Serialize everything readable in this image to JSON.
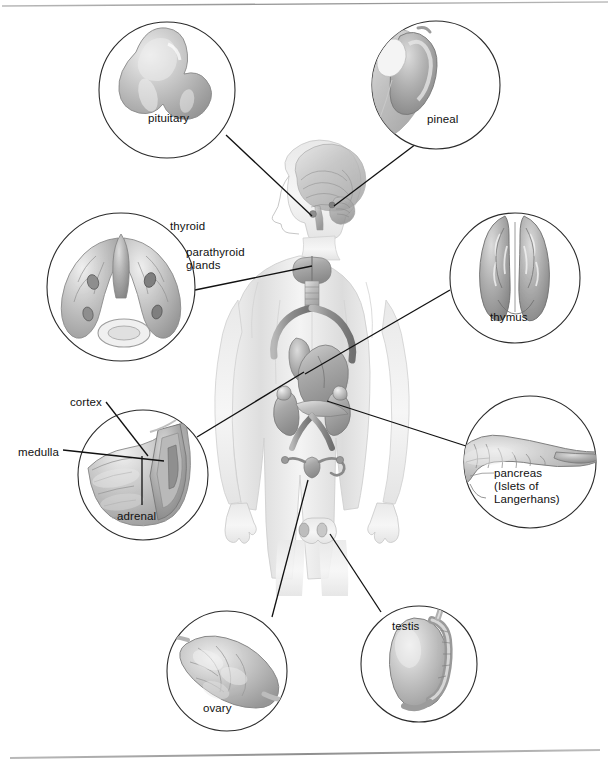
{
  "figure": {
    "background_color": "#ffffff",
    "line_color": "#111111",
    "rule_color": "#9a9a9a"
  },
  "rules": [
    {
      "name": "top-rule",
      "y": 4
    },
    {
      "name": "bottom-rule",
      "y": 755
    }
  ],
  "callouts": [
    {
      "id": "pituitary",
      "label": "pituitary",
      "label_x": 150,
      "label_y": 118,
      "circle": {
        "cx": 167,
        "cy": 90,
        "r": 68
      },
      "leader": {
        "x1": 226,
        "x2": 312,
        "y1": 135,
        "y2": 218
      }
    },
    {
      "id": "pineal",
      "label": "pineal",
      "label_x": 428,
      "label_y": 118,
      "circle": {
        "cx": 436,
        "cy": 85,
        "r": 64
      },
      "leader": {
        "x1": 418,
        "x2": 335,
        "y1": 143,
        "y2": 210
      }
    },
    {
      "id": "thyroid-parathyroid",
      "label": "thyroid",
      "label2": "parathyroid\nglands",
      "label_x": 170,
      "label_y": 227,
      "label2_x": 186,
      "label2_y": 250,
      "circle": {
        "cx": 121,
        "cy": 287,
        "r": 74
      },
      "leader": {
        "x1": 195,
        "x2": 312,
        "y1": 290,
        "y2": 267
      }
    },
    {
      "id": "thymus",
      "label": "thymus",
      "label_x": 492,
      "label_y": 316,
      "circle": {
        "cx": 515,
        "cy": 278,
        "r": 65
      },
      "leader": {
        "x1": 450,
        "x2": 305,
        "y1": 290,
        "y2": 375
      }
    },
    {
      "id": "adrenal",
      "label": "adrenal",
      "label2": "cortex",
      "label3": "medulla",
      "label_x": 118,
      "label_y": 517,
      "label2_x": 71,
      "label2_y": 401,
      "label3_x": 18,
      "label3_y": 453,
      "circle": {
        "cx": 143,
        "cy": 475,
        "r": 65
      },
      "leader": {
        "x1": 196,
        "x2": 305,
        "y1": 437,
        "y2": 372
      }
    },
    {
      "id": "pancreas",
      "label": "pancreas\n(Islets of\nLangerhans)",
      "label_x": 494,
      "label_y": 474,
      "circle": {
        "cx": 530,
        "cy": 462,
        "r": 66
      },
      "leader": {
        "x1": 466,
        "x2": 327,
        "y1": 446,
        "y2": 401
      }
    },
    {
      "id": "ovary",
      "label": "ovary",
      "label_x": 204,
      "label_y": 709,
      "circle": {
        "cx": 227,
        "cy": 671,
        "r": 60
      },
      "leader": {
        "x1": 272,
        "x2": 307,
        "y1": 617,
        "y2": 481
      }
    },
    {
      "id": "testis",
      "label": "testis",
      "label_x": 393,
      "label_y": 626,
      "circle": {
        "cx": 419,
        "cy": 664,
        "r": 58
      },
      "leader": {
        "x1": 381,
        "x2": 330,
        "y1": 613,
        "y2": 534
      }
    }
  ],
  "body_figure": {
    "name": "human-body-silhouette",
    "organs": [
      "brain",
      "pituitary",
      "pineal",
      "thyroid",
      "parathyroid glands",
      "thymus",
      "heart",
      "adrenal glands",
      "kidneys",
      "pancreas",
      "uterus",
      "ovaries",
      "testes"
    ]
  }
}
